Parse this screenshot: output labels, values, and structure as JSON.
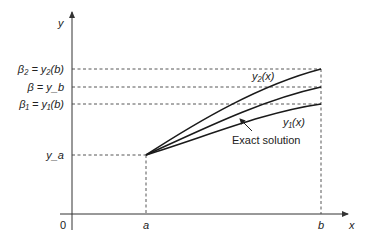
{
  "diagram": {
    "type": "shooting-method",
    "axes": {
      "x_label": "x",
      "y_label": "y",
      "origin_label": "0",
      "x_ticks": [
        {
          "label": "a"
        },
        {
          "label": "b"
        }
      ]
    },
    "y_markers": [
      {
        "id": "beta2",
        "label": "β₂ = y₂(b)"
      },
      {
        "id": "beta",
        "label": "β = y_b"
      },
      {
        "id": "beta1",
        "label": "β₁ = y₁(b)"
      },
      {
        "id": "ya",
        "label": "y_a"
      }
    ],
    "curves": [
      {
        "id": "y2",
        "label": "y₂(x)"
      },
      {
        "id": "exact",
        "label": "Exact solution"
      },
      {
        "id": "y1",
        "label": "y₁(x)"
      }
    ],
    "colors": {
      "line": "#1a1a1a",
      "dashed": "#444444",
      "axis": "#333333"
    }
  }
}
